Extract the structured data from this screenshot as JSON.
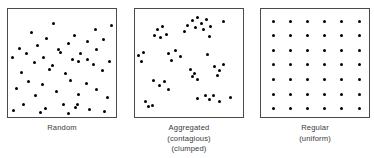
{
  "figure": {
    "background_color": "#ffffff",
    "dot_color": "#000000",
    "frame_color": "#4a4a4a",
    "caption_color": "#3a3a3a"
  },
  "panels": [
    {
      "id": "random",
      "caption_lines": [
        "Random"
      ],
      "frame": {
        "x": 7,
        "y": 8,
        "w": 110,
        "h": 110
      },
      "dot_count": 45,
      "points": [
        [
          45,
          14
        ],
        [
          87,
          20
        ],
        [
          103,
          16
        ],
        [
          23,
          23
        ],
        [
          38,
          29
        ],
        [
          66,
          26
        ],
        [
          60,
          34
        ],
        [
          79,
          32
        ],
        [
          95,
          30
        ],
        [
          11,
          39
        ],
        [
          29,
          36
        ],
        [
          50,
          40
        ],
        [
          52,
          43
        ],
        [
          18,
          44
        ],
        [
          35,
          48
        ],
        [
          72,
          44
        ],
        [
          88,
          40
        ],
        [
          4,
          48
        ],
        [
          26,
          53
        ],
        [
          44,
          56
        ],
        [
          64,
          50
        ],
        [
          70,
          52
        ],
        [
          79,
          50
        ],
        [
          85,
          55
        ],
        [
          101,
          52
        ],
        [
          13,
          63
        ],
        [
          41,
          60
        ],
        [
          57,
          64
        ],
        [
          94,
          61
        ],
        [
          20,
          72
        ],
        [
          34,
          75
        ],
        [
          62,
          71
        ],
        [
          78,
          74
        ],
        [
          8,
          79
        ],
        [
          48,
          82
        ],
        [
          27,
          86
        ],
        [
          70,
          85
        ],
        [
          88,
          80
        ],
        [
          99,
          88
        ],
        [
          15,
          95
        ],
        [
          37,
          99
        ],
        [
          55,
          95
        ],
        [
          67,
          98
        ],
        [
          69,
          95
        ],
        [
          81,
          100
        ],
        [
          5,
          101
        ],
        [
          32,
          103
        ],
        [
          60,
          104
        ],
        [
          96,
          102
        ]
      ]
    },
    {
      "id": "aggregated",
      "caption_lines": [
        "Aggregated",
        "(contagious)",
        "(clumped)"
      ],
      "frame": {
        "x": 134,
        "y": 8,
        "w": 110,
        "h": 110
      },
      "dot_count": 42,
      "points": [
        [
          57,
          11
        ],
        [
          62,
          8
        ],
        [
          66,
          14
        ],
        [
          71,
          10
        ],
        [
          60,
          18
        ],
        [
          68,
          20
        ],
        [
          52,
          16
        ],
        [
          75,
          17
        ],
        [
          88,
          12
        ],
        [
          22,
          20
        ],
        [
          27,
          17
        ],
        [
          19,
          26
        ],
        [
          25,
          28
        ],
        [
          31,
          25
        ],
        [
          49,
          22
        ],
        [
          74,
          27
        ],
        [
          3,
          46
        ],
        [
          8,
          43
        ],
        [
          6,
          52
        ],
        [
          33,
          44
        ],
        [
          40,
          41
        ],
        [
          45,
          47
        ],
        [
          36,
          51
        ],
        [
          72,
          45
        ],
        [
          55,
          60
        ],
        [
          59,
          64
        ],
        [
          57,
          67
        ],
        [
          62,
          70
        ],
        [
          79,
          57
        ],
        [
          84,
          61
        ],
        [
          88,
          55
        ],
        [
          82,
          66
        ],
        [
          18,
          71
        ],
        [
          24,
          76
        ],
        [
          29,
          72
        ],
        [
          33,
          80
        ],
        [
          10,
          92
        ],
        [
          13,
          97
        ],
        [
          17,
          96
        ],
        [
          62,
          89
        ],
        [
          70,
          86
        ],
        [
          74,
          90
        ],
        [
          78,
          86
        ],
        [
          84,
          92
        ],
        [
          95,
          88
        ]
      ]
    },
    {
      "id": "regular",
      "caption_lines": [
        "Regular",
        "(uniform)"
      ],
      "frame": {
        "x": 260,
        "y": 8,
        "w": 110,
        "h": 110
      },
      "dot_count": 42,
      "grid": {
        "columns": 6,
        "rows": 7,
        "x_start": 12,
        "y_start": 12,
        "x_step": 17.2,
        "y_step": 14.6
      }
    }
  ]
}
